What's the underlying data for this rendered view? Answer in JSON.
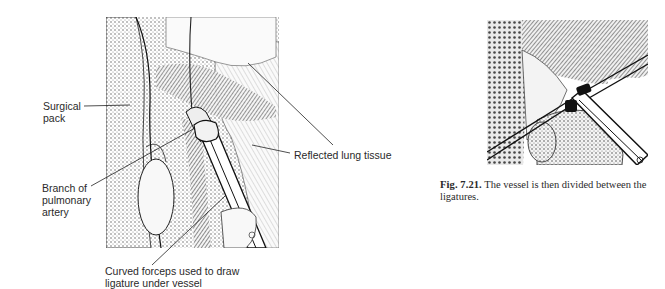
{
  "left_figure": {
    "labels": {
      "surgical_pack": [
        "Surgical",
        "pack"
      ],
      "branch_artery": [
        "Branch of",
        "pulmonary",
        "artery"
      ],
      "reflected_lung": "Reflected lung tissue",
      "curved_forceps": [
        "Curved forceps used to draw",
        "ligature under vessel"
      ]
    }
  },
  "right_figure": {
    "caption": {
      "number": "Fig. 7.21.",
      "text": "The vessel is then divided between the ligatures."
    }
  },
  "colors": {
    "ink": "#2a2a2a",
    "background": "#ffffff"
  }
}
